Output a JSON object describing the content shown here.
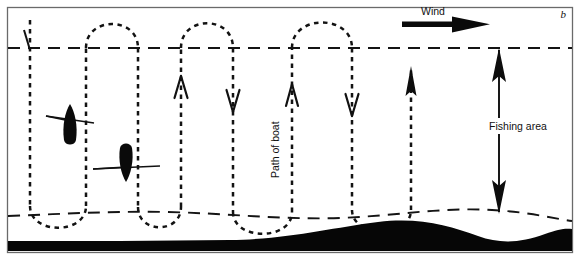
{
  "figure": {
    "panel_label": "b",
    "labels": {
      "wind": "Wind",
      "path_of_boat": "Path of boat",
      "fishing_area": "Fishing area"
    },
    "colors": {
      "ink": "#111111",
      "seabed": "#050505",
      "background": "#ffffff",
      "frame": "#555555",
      "dash": "#1a1a1a"
    }
  },
  "chart_data": {
    "type": "diagram",
    "xlabel": "",
    "ylabel": "",
    "axis_ranges": {
      "x": [
        0,
        580
      ],
      "y": [
        0,
        258
      ]
    },
    "grid": false,
    "legend_position": "none",
    "annotations": [
      {
        "name": "panel-label",
        "text": "b",
        "x": 566,
        "y": 16,
        "style": "italic"
      },
      {
        "name": "wind-label",
        "text": "Wind",
        "x": 433,
        "y": 15,
        "style": "plain"
      },
      {
        "name": "path-of-boat-label",
        "text": "Path of boat",
        "x": 278,
        "y": 148,
        "rotation": -90
      },
      {
        "name": "fishing-area-label",
        "text": "Fishing area",
        "x": 527,
        "y": 128,
        "rotation": 0
      }
    ],
    "boundaries": [
      {
        "name": "upper-fishing-boundary",
        "style": "dashed",
        "y": 48,
        "x_from": 8,
        "x_to": 572
      },
      {
        "name": "lower-fishing-boundary",
        "style": "dashed",
        "y_approx": 213,
        "x_from": 8,
        "x_to": 572,
        "undulating": true
      }
    ],
    "fishing_area_extent": {
      "top_y": 48,
      "bottom_y": 213,
      "measured_at_x": 499
    },
    "wind_arrow": {
      "direction": "right",
      "x_from": 402,
      "x_to": 487,
      "y": 24
    },
    "boats": [
      {
        "name": "boat-1",
        "x": 70,
        "y": 125,
        "heading": "up"
      },
      {
        "name": "boat-2",
        "x": 125,
        "y": 162,
        "heading": "down"
      }
    ],
    "path_direction_arrows": [
      {
        "x": 181,
        "y": 85,
        "direction": "up",
        "head": "open-v"
      },
      {
        "x": 233,
        "y": 95,
        "direction": "down",
        "head": "open-v"
      },
      {
        "x": 292,
        "y": 95,
        "direction": "up",
        "head": "open-v"
      },
      {
        "x": 352,
        "y": 100,
        "direction": "down",
        "head": "open-v"
      },
      {
        "x": 411,
        "y": 80,
        "direction": "up",
        "head": "solid"
      }
    ],
    "path_verticals_x": [
      30,
      86,
      138,
      181,
      233,
      292,
      352,
      411
    ],
    "seabed": {
      "name": "seabed",
      "fill": "#050505",
      "shape": "undulating-band"
    }
  }
}
